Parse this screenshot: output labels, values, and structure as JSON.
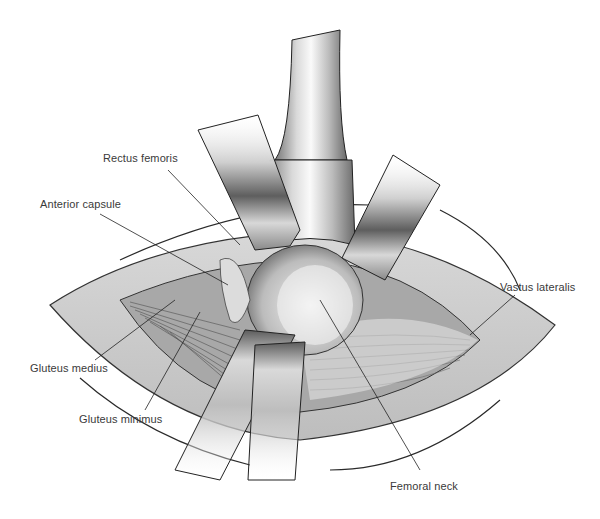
{
  "figure": {
    "type": "surgical anatomical illustration",
    "labels": [
      {
        "id": "rectus-femoris",
        "text": "Rectus femoris",
        "x": 103,
        "y": 160
      },
      {
        "id": "anterior-capsule",
        "text": "Anterior capsule",
        "x": 40,
        "y": 201
      },
      {
        "id": "gluteus-medius",
        "text": "Gluteus medius",
        "x": 30,
        "y": 363
      },
      {
        "id": "gluteus-minimus",
        "text": "Gluteus minimus",
        "x": 79,
        "y": 413
      },
      {
        "id": "vastus-lateralis",
        "text": "Vastus lateralis",
        "x": 500,
        "y": 281
      },
      {
        "id": "femoral-neck",
        "text": "Femoral neck",
        "x": 390,
        "y": 481
      }
    ]
  }
}
